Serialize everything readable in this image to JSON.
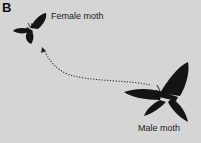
{
  "panel": {
    "label": "B",
    "background": "#d5d5d5"
  },
  "figure": {
    "female": {
      "label": "Female moth",
      "icon": "moth-silhouette-small"
    },
    "male": {
      "label": "Male moth",
      "icon": "moth-silhouette-large"
    },
    "arrow": {
      "style": "dotted",
      "direction": "from male moth to female moth",
      "color": "#333333"
    }
  }
}
